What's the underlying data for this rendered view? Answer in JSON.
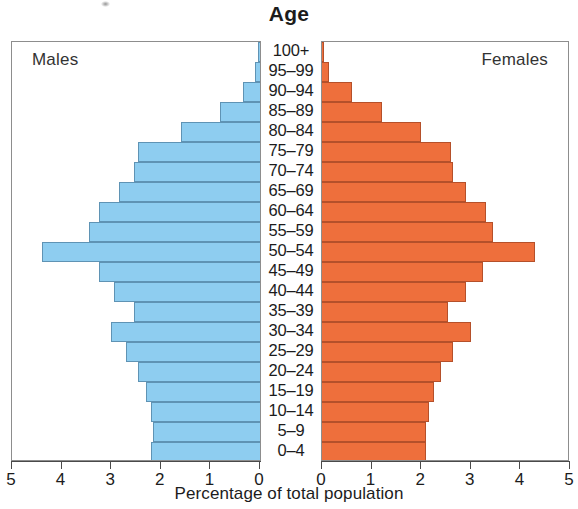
{
  "chart_data": {
    "type": "bar",
    "subtype": "population-pyramid",
    "title": "Age",
    "xlabel": "Percentage of total population",
    "ylabel": "Age",
    "grid": false,
    "legend_position": "in-panel-corners",
    "xlim_left": [
      5,
      0
    ],
    "xlim_right": [
      0,
      5
    ],
    "xticks_left": [
      5,
      4,
      3,
      2,
      1,
      0
    ],
    "xticks_right": [
      0,
      1,
      2,
      3,
      4,
      5
    ],
    "categories": [
      "100+",
      "95–99",
      "90–94",
      "85–89",
      "80–84",
      "75–79",
      "70–74",
      "65–69",
      "60–64",
      "55–59",
      "50–54",
      "45–49",
      "40–44",
      "35–39",
      "30–34",
      "25–29",
      "20–24",
      "15–19",
      "10–14",
      "5–9",
      "0–4"
    ],
    "series": [
      {
        "name": "Males",
        "side": "left",
        "color": "#8ecdf0",
        "edge_color": "#5f93b4",
        "values": [
          0.02,
          0.1,
          0.35,
          0.8,
          1.6,
          2.45,
          2.55,
          2.85,
          3.25,
          3.45,
          4.4,
          3.25,
          2.95,
          2.55,
          3.0,
          2.7,
          2.45,
          2.3,
          2.2,
          2.15,
          2.2
        ]
      },
      {
        "name": "Females",
        "side": "right",
        "color": "#ee6f3c",
        "edge_color": "#b5502a",
        "values": [
          0.03,
          0.15,
          0.6,
          1.2,
          2.0,
          2.6,
          2.65,
          2.9,
          3.3,
          3.45,
          4.3,
          3.25,
          2.9,
          2.55,
          3.0,
          2.65,
          2.4,
          2.25,
          2.15,
          2.1,
          2.1
        ]
      }
    ]
  },
  "chart": {
    "title": "Age",
    "axis_title": "Percentage of total population",
    "males_label": "Males",
    "females_label": "Females"
  }
}
